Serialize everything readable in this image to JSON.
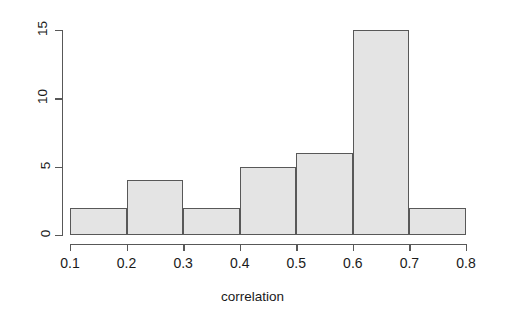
{
  "figure": {
    "background_color": "#ffffff",
    "bar_fill_color": "#e4e4e4",
    "bar_border_color": "#585858",
    "axis_color": "#585858",
    "text_color": "#1a1a1a"
  },
  "chart_data": {
    "type": "bar",
    "title": "",
    "subtitle": "",
    "xlabel": "correlation",
    "ylabel": "",
    "xlim": [
      0.1,
      0.8
    ],
    "ylim": [
      0,
      15
    ],
    "grid": false,
    "legend": null,
    "bin_width": 0.1,
    "bin_edges": [
      0.1,
      0.2,
      0.3,
      0.4,
      0.5,
      0.6,
      0.7,
      0.8
    ],
    "categories": [
      "0.1-0.2",
      "0.2-0.3",
      "0.3-0.4",
      "0.4-0.5",
      "0.5-0.6",
      "0.6-0.7",
      "0.7-0.8"
    ],
    "values": [
      2,
      4,
      2,
      5,
      6,
      15,
      2
    ],
    "total_count": 36,
    "xticks": [
      0.1,
      0.2,
      0.3,
      0.4,
      0.5,
      0.6,
      0.7,
      0.8
    ],
    "xtick_labels": [
      "0.1",
      "0.2",
      "0.3",
      "0.4",
      "0.5",
      "0.6",
      "0.7",
      "0.8"
    ],
    "yticks": [
      0,
      5,
      10,
      15
    ],
    "ytick_labels": [
      "0",
      "5",
      "10",
      "15"
    ]
  }
}
